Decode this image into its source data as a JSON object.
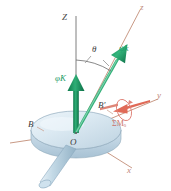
{
  "figure": {
    "kind": "mechanics-diagram",
    "background_color": "#ffffff",
    "colors": {
      "axis": "#c99a86",
      "vertical_axis": "#6b6b6b",
      "vector_green": "#1f9d68",
      "vector_green_dark": "#0f7a4e",
      "moment_red": "#e0604f",
      "disk_body": "#d4e3ee",
      "disk_edge": "#9fb8c9",
      "shaft": "#b9cfdd",
      "label_dark": "#3c3c3c"
    }
  },
  "axes": [
    {
      "name": "Z",
      "label": "Z",
      "desc": "fixed vertical axis",
      "color": "#6b6b6b"
    },
    {
      "name": "z",
      "label": "z",
      "desc": "spin axis of rotor",
      "color": "#c99a86"
    },
    {
      "name": "y",
      "label": "y",
      "desc": "transverse horizontal axis",
      "color": "#c99a86"
    },
    {
      "name": "x",
      "label": "x",
      "desc": "transverse axis toward viewer",
      "color": "#c99a86"
    }
  ],
  "vectors": [
    {
      "name": "precession-rate",
      "symbol_body": "K",
      "symbol_greek": "φ",
      "label": "φ̇K",
      "direction": "vertical up along Z",
      "color": "#1f9d68"
    },
    {
      "name": "spin-rate",
      "symbol_body": "k",
      "symbol_greek": "ψ",
      "label": "ψ̇k",
      "direction": "up-right along z",
      "color": "#1f9d68"
    },
    {
      "name": "applied-moment",
      "label": "ΣM",
      "subscript": "O",
      "full_label": "ΣMₒ",
      "direction": "along negative y toward O",
      "color": "#e0604f"
    }
  ],
  "angles": [
    {
      "name": "nutation-angle",
      "label": "θ",
      "between": "Z and z"
    }
  ],
  "points": [
    {
      "name": "origin",
      "label": "O"
    },
    {
      "name": "rim-left",
      "label": "B"
    },
    {
      "name": "rim-right",
      "label": "B′"
    }
  ],
  "body": {
    "name": "rotor-disk-with-shaft",
    "description": "pale blue circular disk (rotor) mounted on a cylindrical shaft"
  }
}
